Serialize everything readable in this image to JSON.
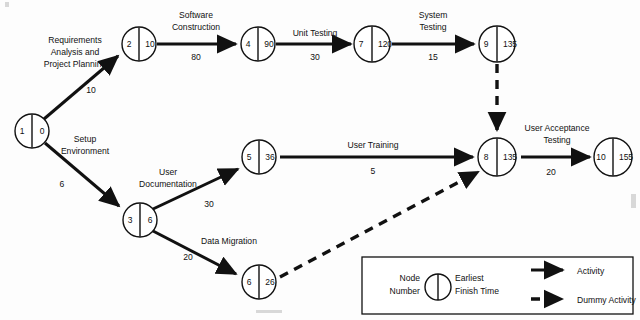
{
  "diagram": {
    "type": "activity-on-arrow-network",
    "nodes": [
      {
        "id": "n1",
        "number": "1",
        "efт": "0",
        "earliest_finish_time": "0",
        "cx": 32,
        "cy": 131
      },
      {
        "id": "n2",
        "number": "2",
        "earliest_finish_time": "10",
        "cx": 139,
        "cy": 44
      },
      {
        "id": "n4",
        "number": "4",
        "earliest_finish_time": "90",
        "cx": 258,
        "cy": 44
      },
      {
        "id": "n7",
        "number": "7",
        "earliest_finish_time": "120",
        "cx": 372,
        "cy": 44
      },
      {
        "id": "n9",
        "number": "9",
        "earliest_finish_time": "135",
        "cx": 497,
        "cy": 44
      },
      {
        "id": "n3",
        "number": "3",
        "earliest_finish_time": "6",
        "cx": 140,
        "cy": 220
      },
      {
        "id": "n5",
        "number": "5",
        "earliest_finish_time": "36",
        "cx": 259,
        "cy": 158
      },
      {
        "id": "n6",
        "number": "6",
        "earliest_finish_time": "26",
        "cx": 259,
        "cy": 282
      },
      {
        "id": "n8",
        "number": "8",
        "earliest_finish_time": "135",
        "cx": 497,
        "cy": 157
      },
      {
        "id": "n10",
        "number": "10",
        "earliest_finish_time": "155",
        "cx": 613,
        "cy": 157
      }
    ],
    "activities": [
      {
        "id": "a1",
        "name": "Requirements Analysis and Project Planning",
        "label_lines": [
          "Requirements",
          "Analysis and",
          "Project Planning"
        ],
        "duration": "10",
        "from": "1",
        "to": "2",
        "kind": "activity"
      },
      {
        "id": "a2",
        "name": "Software Construction",
        "label_lines": [
          "Software",
          "Construction"
        ],
        "duration": "80",
        "from": "2",
        "to": "4",
        "kind": "activity"
      },
      {
        "id": "a3",
        "name": "Unit Testing",
        "label_lines": [
          "Unit Testing"
        ],
        "duration": "30",
        "from": "4",
        "to": "7",
        "kind": "activity"
      },
      {
        "id": "a4",
        "name": "System Testing",
        "label_lines": [
          "System",
          "Testing"
        ],
        "duration": "15",
        "from": "7",
        "to": "9",
        "kind": "activity"
      },
      {
        "id": "a5",
        "name": "Setup Environment",
        "label_lines": [
          "Setup",
          "Environment"
        ],
        "duration": "6",
        "from": "1",
        "to": "3",
        "kind": "activity"
      },
      {
        "id": "a6",
        "name": "User Documentation",
        "label_lines": [
          "User",
          "Documentation"
        ],
        "duration": "30",
        "from": "3",
        "to": "5",
        "kind": "activity"
      },
      {
        "id": "a7",
        "name": "Data Migration",
        "label_lines": [
          "Data Migration"
        ],
        "duration": "20",
        "from": "3",
        "to": "6",
        "kind": "activity"
      },
      {
        "id": "a8",
        "name": "User Training",
        "label_lines": [
          "User Training"
        ],
        "duration": "5",
        "from": "5",
        "to": "8",
        "kind": "activity"
      },
      {
        "id": "a9",
        "name": "User Acceptance Testing",
        "label_lines": [
          "User Acceptance",
          "Testing"
        ],
        "duration": "20",
        "from": "8",
        "to": "10",
        "kind": "activity"
      },
      {
        "id": "d1",
        "name": "Dummy from 9 to 8",
        "label_lines": [],
        "duration": "",
        "from": "9",
        "to": "8",
        "kind": "dummy"
      },
      {
        "id": "d2",
        "name": "Dummy from 6 to 8",
        "label_lines": [],
        "duration": "",
        "from": "6",
        "to": "8",
        "kind": "dummy"
      }
    ],
    "labels": {
      "req_line1": "Requirements",
      "req_line2": "Analysis and",
      "req_line3": "Project Planning",
      "req_dur": "10",
      "soft_line1": "Software",
      "soft_line2": "Construction",
      "soft_dur": "80",
      "unit_line1": "Unit Testing",
      "unit_dur": "30",
      "sys_line1": "System",
      "sys_line2": "Testing",
      "sys_dur": "15",
      "setup_line1": "Setup",
      "setup_line2": "Environment",
      "setup_dur": "6",
      "userdoc_line1": "User",
      "userdoc_line2": "Documentation",
      "userdoc_dur": "30",
      "datamig_line1": "Data Migration",
      "datamig_dur": "20",
      "usertrain_line1": "User Training",
      "usertrain_dur": "5",
      "uat_line1": "User Acceptance",
      "uat_line2": "Testing",
      "uat_dur": "20"
    },
    "node_values": {
      "n1_num": "1",
      "n1_eft": "0",
      "n2_num": "2",
      "n2_eft": "10",
      "n3_num": "3",
      "n3_eft": "6",
      "n4_num": "4",
      "n4_eft": "90",
      "n5_num": "5",
      "n5_eft": "36",
      "n6_num": "6",
      "n6_eft": "26",
      "n7_num": "7",
      "n7_eft": "120",
      "n8_num": "8",
      "n8_eft": "135",
      "n9_num": "9",
      "n9_eft": "135",
      "n10_num": "10",
      "n10_eft": "155"
    },
    "legend": {
      "node_line1": "Node",
      "node_line2": "Number",
      "eft_line1": "Earliest",
      "eft_line2": "Finish Time",
      "activity": "Activity",
      "dummy_activity": "Dummy Activity"
    },
    "colors": {
      "ink": "#111111",
      "paper": "#fdfdfd",
      "node_fill": "#ffffff"
    }
  }
}
